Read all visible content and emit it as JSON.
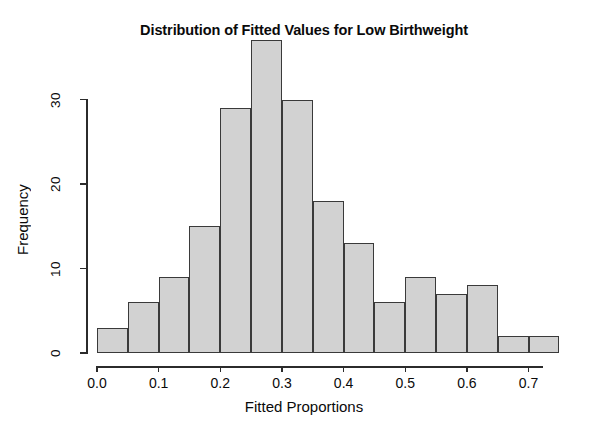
{
  "chart_data": {
    "type": "bar",
    "subtype": "histogram",
    "title": "Distribution of Fitted Values for Low Birthweight",
    "xlabel": "Fitted Proportions",
    "ylabel": "Frequency",
    "xlim": [
      0.0,
      0.75
    ],
    "ylim": [
      0,
      37
    ],
    "grid": false,
    "legend": null,
    "bin_width": 0.05,
    "xticks": [
      0.0,
      0.1,
      0.2,
      0.3,
      0.4,
      0.5,
      0.6,
      0.7
    ],
    "xtick_labels": [
      "0.0",
      "0.1",
      "0.2",
      "0.3",
      "0.4",
      "0.5",
      "0.6",
      "0.7"
    ],
    "yticks": [
      0,
      10,
      20,
      30
    ],
    "ytick_labels": [
      "0",
      "10",
      "20",
      "30"
    ],
    "bin_edges": [
      0.0,
      0.05,
      0.1,
      0.15,
      0.2,
      0.25,
      0.3,
      0.35,
      0.4,
      0.45,
      0.5,
      0.55,
      0.6,
      0.65,
      0.7,
      0.75
    ],
    "categories": [
      "0.00-0.05",
      "0.05-0.10",
      "0.10-0.15",
      "0.15-0.20",
      "0.20-0.25",
      "0.25-0.30",
      "0.30-0.35",
      "0.35-0.40",
      "0.40-0.45",
      "0.45-0.50",
      "0.50-0.55",
      "0.55-0.60",
      "0.60-0.65",
      "0.65-0.70",
      "0.70-0.75"
    ],
    "values": [
      3,
      6,
      9,
      15,
      29,
      37,
      30,
      18,
      13,
      6,
      9,
      7,
      8,
      2,
      2
    ],
    "bar_fill_color": "#d2d2d2",
    "bar_edge_color": "#3a3a3a",
    "axis_color": "#2b2b2b",
    "background_color": "#ffffff"
  }
}
